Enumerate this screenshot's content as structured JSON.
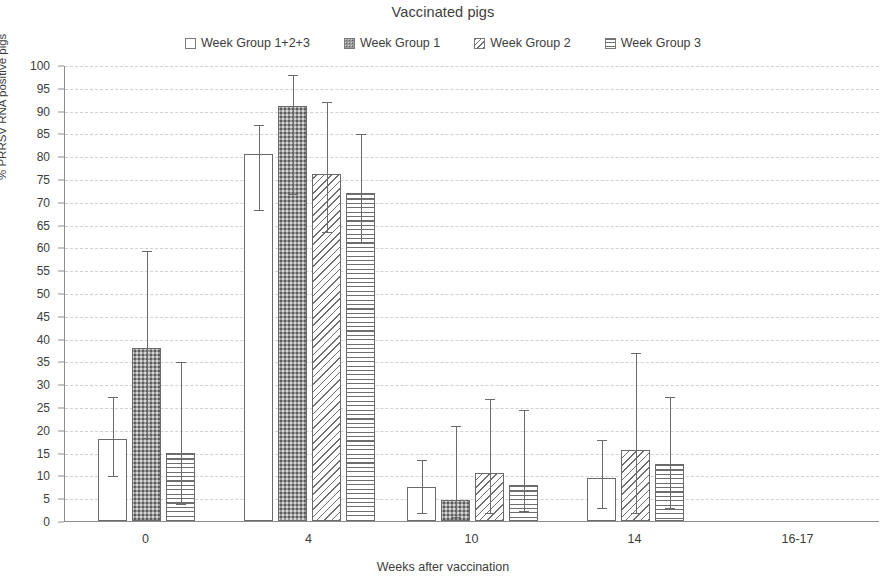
{
  "title": "Vaccinated pigs",
  "axes": {
    "y_title": "% PRRSV RNA positive pigs",
    "x_title": "Weeks after vaccination"
  },
  "legend": [
    {
      "label": "Week Group 1+2+3",
      "pattern": "solid-white"
    },
    {
      "label": "Week Group 1",
      "pattern": "dotted-dark"
    },
    {
      "label": "Week Group 2",
      "pattern": "diagonal"
    },
    {
      "label": "Week Group 3",
      "pattern": "horizontal"
    }
  ],
  "chart_data": {
    "type": "bar",
    "title": "Vaccinated pigs",
    "xlabel": "Weeks after vaccination",
    "ylabel": "% PRRSV RNA positive pigs",
    "ylim": [
      0,
      100
    ],
    "yticks": [
      0,
      5,
      10,
      15,
      20,
      25,
      30,
      35,
      40,
      45,
      50,
      55,
      60,
      65,
      70,
      75,
      80,
      85,
      90,
      95,
      100
    ],
    "grid": true,
    "legend_position": "top-center",
    "categories": [
      "0",
      "4",
      "10",
      "14",
      "16-17"
    ],
    "series": [
      {
        "name": "Week Group 1+2+3",
        "pattern": "solid-white",
        "values": [
          18,
          80.5,
          7.5,
          9.5,
          null
        ],
        "err_low": [
          10,
          68.5,
          2,
          3,
          null
        ],
        "err_high": [
          27.5,
          87,
          13.5,
          18,
          null
        ]
      },
      {
        "name": "Week Group 1",
        "pattern": "dotted-dark",
        "values": [
          38,
          91,
          4.5,
          null,
          null
        ],
        "err_low": [
          18.5,
          72,
          1,
          null,
          null
        ],
        "err_high": [
          59.5,
          98,
          21,
          null,
          null
        ]
      },
      {
        "name": "Week Group 2",
        "pattern": "diagonal",
        "values": [
          null,
          76,
          10.5,
          15.5,
          null
        ],
        "err_low": [
          null,
          63.5,
          2,
          2,
          null
        ],
        "err_high": [
          null,
          92,
          27,
          37,
          null
        ]
      },
      {
        "name": "Week Group 3",
        "pattern": "horizontal",
        "values": [
          15,
          72,
          8,
          12.5,
          null
        ],
        "err_low": [
          4,
          61.5,
          2.5,
          3,
          null
        ],
        "err_high": [
          35,
          85,
          24.5,
          27.5,
          null
        ]
      }
    ]
  }
}
